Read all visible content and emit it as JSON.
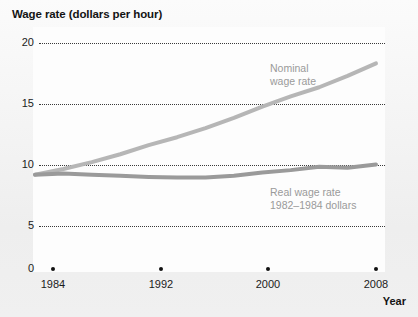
{
  "chart_data": {
    "type": "line",
    "title": "Wage rate (dollars per hour)",
    "ylabel": "Wage rate (dollars per hour)",
    "xlabel": "Year",
    "xlim": [
      1984,
      2008
    ],
    "ylim": [
      0,
      20
    ],
    "yticks": [
      20,
      15,
      10,
      5,
      0
    ],
    "ytick_labels": [
      "20",
      "15",
      "10",
      "5",
      "0"
    ],
    "xticks": [
      1984,
      1992,
      2000,
      2008
    ],
    "xtick_labels": [
      "1984",
      "1992",
      "2000",
      "2008"
    ],
    "grid": "horizontal-dotted",
    "legend_position": "inline-annotations",
    "x": [
      1984,
      1986,
      1988,
      1990,
      1992,
      1994,
      1996,
      1998,
      2000,
      2002,
      2004,
      2006,
      2008
    ],
    "series": [
      {
        "name": "Nominal wage rate",
        "label": "Nominal\nwage rate",
        "color": "#b6b6b6",
        "values": [
          8.4,
          8.9,
          9.5,
          10.2,
          11.0,
          11.7,
          12.5,
          13.4,
          14.4,
          15.3,
          16.1,
          17.1,
          18.2
        ]
      },
      {
        "name": "Real wage rate 1982-1984 dollars",
        "label": "Real wage rate\n1982–1984 dollars",
        "color": "#9a9a9a",
        "values": [
          8.4,
          8.5,
          8.4,
          8.3,
          8.2,
          8.15,
          8.15,
          8.3,
          8.6,
          8.8,
          9.1,
          9.0,
          9.3
        ]
      }
    ],
    "colors": {
      "nominal_line": "#b6b6b6",
      "real_line": "#9a9a9a",
      "gridline": "#3a3a3a",
      "tick_dot": "#111111",
      "axis_text": "#1b1b1b",
      "title_text": "#141414",
      "annotation_text": "#9a9a9a",
      "plot_background": "#fdfdfd",
      "page_background": "#f2f2f2"
    }
  }
}
